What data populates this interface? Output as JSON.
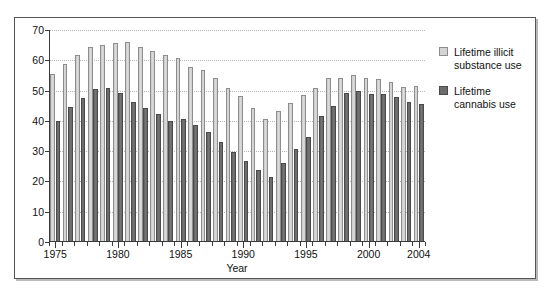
{
  "chart_data": {
    "type": "bar",
    "title": "",
    "xlabel": "Year",
    "ylabel": "",
    "ylim": [
      0,
      70
    ],
    "ytick_step": 10,
    "yticks": [
      0,
      10,
      20,
      30,
      40,
      50,
      60,
      70
    ],
    "grid": true,
    "legend_position": "right",
    "categories": [
      "1975",
      "1976",
      "1977",
      "1978",
      "1979",
      "1980",
      "1981",
      "1982",
      "1983",
      "1984",
      "1985",
      "1986",
      "1987",
      "1988",
      "1989",
      "1990",
      "1991",
      "1992",
      "1993",
      "1994",
      "1995",
      "1996",
      "1997",
      "1998",
      "1999",
      "2000",
      "2001",
      "2002",
      "2003",
      "2004"
    ],
    "xtick_labels": [
      "1975",
      "1980",
      "1985",
      "1990",
      "1995",
      "2000",
      "2004"
    ],
    "series": [
      {
        "name": "Lifetime illicit substance use",
        "color": "#d4d4d4",
        "values": [
          55.6,
          58.9,
          61.9,
          64.4,
          65.2,
          65.6,
          66.0,
          64.4,
          63.0,
          61.8,
          60.9,
          57.8,
          56.8,
          54.1,
          50.9,
          48.3,
          44.3,
          40.7,
          43.3,
          45.9,
          48.4,
          50.8,
          54.3,
          54.1,
          55.0,
          54.0,
          53.9,
          53.0,
          51.1,
          51.4
        ]
      },
      {
        "name": "Lifetime cannabis use",
        "color": "#6d6d6d",
        "values": [
          40.0,
          44.5,
          47.6,
          50.5,
          50.8,
          49.2,
          46.1,
          44.3,
          42.3,
          40.0,
          40.6,
          38.8,
          36.3,
          33.1,
          29.6,
          26.7,
          23.7,
          21.4,
          26.0,
          30.8,
          34.7,
          41.7,
          44.9,
          49.1,
          49.7,
          48.8,
          49.0,
          47.8,
          46.1,
          45.7
        ]
      }
    ]
  },
  "legend": {
    "items": [
      {
        "label_line1": "Lifetime illicit",
        "label_line2": "substance use",
        "swatch": "illicit"
      },
      {
        "label_line1": "Lifetime",
        "label_line2": "cannabis use",
        "swatch": "cannabis"
      }
    ]
  },
  "axis": {
    "x_title": "Year"
  }
}
